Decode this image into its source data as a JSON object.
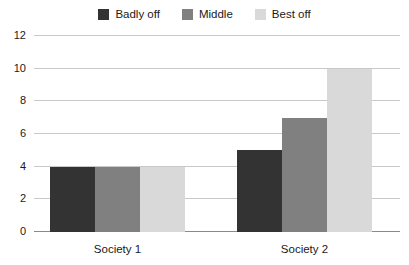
{
  "chart_data": {
    "type": "bar",
    "title": "",
    "subtitle": "",
    "xlabel": "",
    "ylabel": "",
    "categories": [
      "Society 1",
      "Society 2"
    ],
    "series": [
      {
        "name": "Badly off",
        "color": "#333333",
        "values": [
          4,
          5
        ]
      },
      {
        "name": "Middle",
        "color": "#808080",
        "values": [
          4,
          7
        ]
      },
      {
        "name": "Best off",
        "color": "#d9d9d9",
        "values": [
          4,
          10
        ]
      }
    ],
    "ylim": [
      0,
      12
    ],
    "yticks": [
      0,
      2,
      4,
      6,
      8,
      10,
      12
    ],
    "ytick_labels": [
      "0",
      "2",
      "4",
      "6",
      "8",
      "10",
      "12"
    ],
    "grid": true,
    "grid_color": "#c8c8c8",
    "axis_color": "#8a8a8a",
    "legend_position": "top-center",
    "background": "#ffffff"
  },
  "legend": {
    "entries": [
      {
        "label": "Badly off",
        "swatch": "legend-swatch-badly-off"
      },
      {
        "label": "Middle",
        "swatch": "legend-swatch-middle"
      },
      {
        "label": "Best off",
        "swatch": "legend-swatch-best-off"
      }
    ]
  }
}
